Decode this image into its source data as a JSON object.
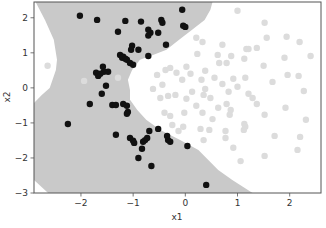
{
  "chart_data": {
    "type": "scatter",
    "title": "",
    "xlabel": "x1",
    "ylabel": "x2",
    "xlim": [
      -2.9,
      2.6
    ],
    "ylim": [
      -3.0,
      2.45
    ],
    "xticks": [
      -2,
      -1,
      0,
      1,
      2
    ],
    "yticks": [
      -3,
      -2,
      -1,
      0,
      1,
      2
    ],
    "xtick_labels": [
      "−2",
      "−1",
      "0",
      "1",
      "2"
    ],
    "ytick_labels": [
      "−3",
      "−2",
      "−1",
      "0",
      "1",
      "2"
    ],
    "grid": false,
    "legend": null,
    "colors": {
      "region_class1": "#c9c9c9",
      "region_class0": "#ffffff",
      "class1_points": "#111111",
      "class0_points": "#dcdcdc",
      "axes": "#555555"
    },
    "decision_region_class1": [
      [
        -2.87,
        2.45
      ],
      [
        -2.69,
        1.94
      ],
      [
        -2.52,
        1.37
      ],
      [
        -2.46,
        0.8
      ],
      [
        -2.48,
        0.51
      ],
      [
        -2.6,
        0.0
      ],
      [
        -2.75,
        -0.2
      ],
      [
        -2.9,
        -0.43
      ],
      [
        -2.9,
        -2.63
      ],
      [
        -2.63,
        -3.0
      ],
      [
        1.29,
        -3.0
      ],
      [
        0.9,
        -2.63
      ],
      [
        0.63,
        -2.34
      ],
      [
        0.44,
        -2.06
      ],
      [
        0.25,
        -1.77
      ],
      [
        -0.1,
        -1.49
      ],
      [
        -0.48,
        -1.2
      ],
      [
        -0.75,
        -0.91
      ],
      [
        -0.92,
        -0.63
      ],
      [
        -1.06,
        -0.34
      ],
      [
        -1.06,
        -0.06
      ],
      [
        -1.1,
        0.23
      ],
      [
        -1.02,
        0.51
      ],
      [
        -0.87,
        0.8
      ],
      [
        -0.62,
        0.94
      ],
      [
        -0.36,
        1.09
      ],
      [
        -0.12,
        1.37
      ],
      [
        0.13,
        1.66
      ],
      [
        0.37,
        1.94
      ],
      [
        0.48,
        2.23
      ],
      [
        0.52,
        2.45
      ]
    ],
    "series": [
      {
        "name": "class 1",
        "color": "#111111",
        "points": [
          [
            -2.02,
            2.06
          ],
          [
            -1.69,
            1.94
          ],
          [
            -1.15,
            1.91
          ],
          [
            -0.85,
            1.89
          ],
          [
            -0.52,
            1.57
          ],
          [
            -0.46,
            1.94
          ],
          [
            -0.44,
            1.86
          ],
          [
            -0.06,
            2.23
          ],
          [
            -0.04,
            1.77
          ],
          [
            0.0,
            1.74
          ],
          [
            -0.71,
            1.66
          ],
          [
            -0.67,
            1.57
          ],
          [
            -0.71,
            1.49
          ],
          [
            -1.29,
            1.6
          ],
          [
            -1.02,
            1.2
          ],
          [
            -1.04,
            1.09
          ],
          [
            -0.9,
            1.09
          ],
          [
            -1.25,
            0.94
          ],
          [
            -1.19,
            0.89
          ],
          [
            -1.21,
            0.86
          ],
          [
            -1.15,
            0.83
          ],
          [
            -1.12,
            0.8
          ],
          [
            -1.06,
            0.71
          ],
          [
            -0.71,
            0.91
          ],
          [
            -1.0,
            0.66
          ],
          [
            -0.37,
            1.23
          ],
          [
            -1.58,
            0.6
          ],
          [
            -1.56,
            0.46
          ],
          [
            -1.71,
            0.43
          ],
          [
            -1.67,
            0.34
          ],
          [
            -1.63,
            0.4
          ],
          [
            -1.48,
            0.46
          ],
          [
            -1.52,
            0.06
          ],
          [
            -1.6,
            -0.17
          ],
          [
            -1.83,
            -0.46
          ],
          [
            -1.4,
            -0.49
          ],
          [
            -1.33,
            -0.49
          ],
          [
            -1.19,
            -0.46
          ],
          [
            -1.12,
            -0.51
          ],
          [
            -1.1,
            -0.69
          ],
          [
            -1.12,
            -0.74
          ],
          [
            -1.33,
            -1.34
          ],
          [
            -1.06,
            -1.43
          ],
          [
            -1.0,
            -1.51
          ],
          [
            -0.98,
            -1.57
          ],
          [
            -0.81,
            -1.54
          ],
          [
            -0.77,
            -1.49
          ],
          [
            -0.73,
            -1.43
          ],
          [
            -0.69,
            -1.23
          ],
          [
            -0.52,
            -1.17
          ],
          [
            -0.35,
            -1.37
          ],
          [
            -0.33,
            -1.49
          ],
          [
            -0.29,
            -1.54
          ],
          [
            0.04,
            -1.66
          ],
          [
            -0.83,
            -1.74
          ],
          [
            -0.9,
            -2.0
          ],
          [
            -0.65,
            -2.23
          ],
          [
            0.4,
            -2.77
          ],
          [
            -2.25,
            -1.03
          ]
        ]
      },
      {
        "name": "class 0",
        "color": "#dcdcdc",
        "points": [
          [
            1.0,
            2.2
          ],
          [
            1.52,
            1.86
          ],
          [
            1.56,
            1.43
          ],
          [
            1.94,
            1.46
          ],
          [
            2.19,
            1.31
          ],
          [
            0.71,
            1.23
          ],
          [
            1.17,
            1.11
          ],
          [
            0.88,
            0.91
          ],
          [
            1.21,
            1.11
          ],
          [
            1.37,
            1.14
          ],
          [
            0.62,
            0.94
          ],
          [
            0.21,
            1.43
          ],
          [
            0.33,
            1.31
          ],
          [
            0.23,
            0.97
          ],
          [
            0.65,
            0.71
          ],
          [
            0.79,
            0.71
          ],
          [
            1.13,
            0.83
          ],
          [
            1.5,
            0.63
          ],
          [
            1.9,
            0.86
          ],
          [
            2.4,
            0.91
          ],
          [
            1.96,
            0.37
          ],
          [
            2.17,
            0.34
          ],
          [
            1.67,
            0.17
          ],
          [
            1.15,
            0.29
          ],
          [
            0.92,
            0.26
          ],
          [
            0.71,
            0.11
          ],
          [
            0.56,
            0.29
          ],
          [
            0.38,
            0.49
          ],
          [
            0.31,
            0.23
          ],
          [
            0.38,
            -0.03
          ],
          [
            0.83,
            -0.11
          ],
          [
            1.0,
            0.03
          ],
          [
            1.21,
            -0.17
          ],
          [
            2.27,
            -0.09
          ],
          [
            0.02,
            0.6
          ],
          [
            0.1,
            0.4
          ],
          [
            -0.38,
            0.51
          ],
          [
            -0.29,
            0.57
          ],
          [
            -0.17,
            0.43
          ],
          [
            -0.06,
            0.23
          ],
          [
            -0.54,
            0.37
          ],
          [
            -0.44,
            0.09
          ],
          [
            -0.62,
            -0.03
          ],
          [
            -0.48,
            -0.29
          ],
          [
            -0.33,
            -0.23
          ],
          [
            -0.19,
            -0.2
          ],
          [
            0.02,
            -0.31
          ],
          [
            0.13,
            -0.11
          ],
          [
            0.35,
            -0.2
          ],
          [
            0.48,
            -0.29
          ],
          [
            0.63,
            -0.57
          ],
          [
            0.79,
            -0.46
          ],
          [
            0.87,
            -0.63
          ],
          [
            0.85,
            -0.77
          ],
          [
            0.21,
            -0.51
          ],
          [
            0.33,
            -0.71
          ],
          [
            0.52,
            -0.89
          ],
          [
            -0.4,
            -0.71
          ],
          [
            -0.02,
            -0.71
          ],
          [
            -0.29,
            -0.8
          ],
          [
            -0.13,
            -1.23
          ],
          [
            0.29,
            -1.17
          ],
          [
            1.12,
            -1.2
          ],
          [
            1.15,
            -1.11
          ],
          [
            0.77,
            -1.23
          ],
          [
            0.77,
            -1.43
          ],
          [
            0.92,
            -1.71
          ],
          [
            1.29,
            -0.29
          ],
          [
            1.37,
            -0.46
          ],
          [
            1.92,
            -0.57
          ],
          [
            2.31,
            -0.91
          ],
          [
            -0.25,
            -1.06
          ],
          [
            -0.04,
            -1.11
          ],
          [
            0.35,
            -1.49
          ],
          [
            0.46,
            -1.2
          ],
          [
            1.06,
            -2.09
          ],
          [
            1.52,
            -0.77
          ],
          [
            1.13,
            -1.03
          ],
          [
            2.2,
            -1.4
          ],
          [
            1.71,
            -1.37
          ],
          [
            2.15,
            -1.77
          ],
          [
            1.52,
            -1.94
          ],
          [
            -2.64,
            0.63
          ],
          [
            -1.94,
            0.2
          ],
          [
            -1.29,
            0.29
          ],
          [
            -1.13,
            -0.46
          ]
        ]
      }
    ]
  }
}
